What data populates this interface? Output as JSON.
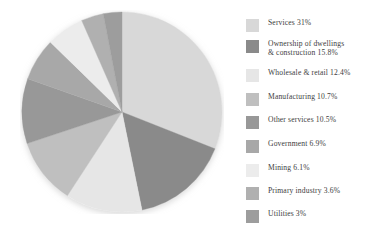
{
  "chart_data": {
    "type": "pie",
    "title": "",
    "subtitle": "",
    "xlabel": "",
    "ylabel": "",
    "legend_position": "right",
    "grid": false,
    "start_angle_deg": 0,
    "direction": "clockwise",
    "units": "percent",
    "categories": [
      "Services",
      "Ownership of dwellings & construction",
      "Wholesale & retail",
      "Manufacturing",
      "Other services",
      "Government",
      "Mining",
      "Primary industry",
      "Utilities"
    ],
    "values": [
      31,
      15.8,
      12.4,
      10.7,
      10.5,
      6.9,
      6.1,
      3.6,
      3
    ],
    "value_labels": [
      "31%",
      "15.8%",
      "12.4%",
      "10.7%",
      "10.5%",
      "6.9%",
      "6.1%",
      "3.6%",
      "3%"
    ],
    "colors": [
      "#d8d8d8",
      "#8a8a8a",
      "#e6e6e6",
      "#bfbfbf",
      "#989898",
      "#a8a8a8",
      "#ececec",
      "#b0b0b0",
      "#9d9d9d"
    ]
  },
  "legend": {
    "items": [
      {
        "label": "Services 31%",
        "color": "#d8d8d8",
        "swatch_name": "legend-swatch-services"
      },
      {
        "label": "Ownership of dwellings\n& construction 15.8%",
        "color": "#8a8a8a",
        "swatch_name": "legend-swatch-ownership-of-dwellings-construction"
      },
      {
        "label": "Wholesale & retail 12.4%",
        "color": "#e6e6e6",
        "swatch_name": "legend-swatch-wholesale-retail"
      },
      {
        "label": "Manufacturing 10.7%",
        "color": "#bfbfbf",
        "swatch_name": "legend-swatch-manufacturing"
      },
      {
        "label": "Other services 10.5%",
        "color": "#989898",
        "swatch_name": "legend-swatch-other-services"
      },
      {
        "label": "Government 6.9%",
        "color": "#a8a8a8",
        "swatch_name": "legend-swatch-government"
      },
      {
        "label": "Mining 6.1%",
        "color": "#ececec",
        "swatch_name": "legend-swatch-mining"
      },
      {
        "label": "Primary industry 3.6%",
        "color": "#b0b0b0",
        "swatch_name": "legend-swatch-primary-industry"
      },
      {
        "label": "Utilities 3%",
        "color": "#9d9d9d",
        "swatch_name": "legend-swatch-utilities"
      }
    ],
    "item_tops": [
      10,
      31,
      60,
      84,
      107,
      131,
      155,
      178,
      201
    ]
  },
  "pie": {
    "center_x": 102,
    "center_y": 102,
    "radius": 100,
    "shadow_color": "#e3e3e3"
  }
}
